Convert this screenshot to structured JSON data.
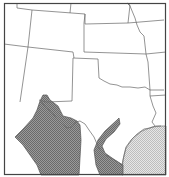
{
  "map": {
    "title": "",
    "region": "South-central United States and northern Mexico",
    "features": [
      {
        "name": "state-borders",
        "description": "State boundary lines (Texas, New Mexico, Oklahoma, Colorado, Kansas and neighbors)"
      },
      {
        "name": "range-west",
        "fill": "dark-stipple",
        "description": "Shaded range in western Texas / northern Mexico along Rio Grande"
      },
      {
        "name": "range-central",
        "fill": "dark-stipple",
        "description": "Curved shaded band in south-central Texas"
      },
      {
        "name": "gulf-area",
        "fill": "light-stipple",
        "description": "Lightly shaded Gulf of Mexico area"
      }
    ],
    "colors": {
      "border": "#555555",
      "dark_fill": "#8c8c8c",
      "light_fill": "#d6d6d6",
      "background": "#ffffff"
    }
  }
}
